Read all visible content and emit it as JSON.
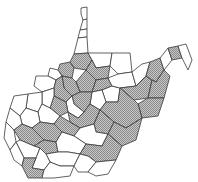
{
  "map": {
    "title": "West Virginia counties",
    "shade_color": "#9a9a9a",
    "plain_color": "#ffffff",
    "border_color": "#3a3a3a",
    "legend": {
      "shaded": "highlighted",
      "plain": "not highlighted"
    },
    "counties": [
      {
        "id": "hancock",
        "shaded": false
      },
      {
        "id": "brooke",
        "shaded": false
      },
      {
        "id": "ohio",
        "shaded": false
      },
      {
        "id": "marshall",
        "shaded": false
      },
      {
        "id": "wetzel",
        "shaded": true
      },
      {
        "id": "monongalia",
        "shaded": false
      },
      {
        "id": "preston",
        "shaded": false
      },
      {
        "id": "tyler",
        "shaded": true
      },
      {
        "id": "pleasants",
        "shaded": false
      },
      {
        "id": "wood",
        "shaded": false
      },
      {
        "id": "ritchie",
        "shaded": true
      },
      {
        "id": "doddridge",
        "shaded": true
      },
      {
        "id": "harrison",
        "shaded": true
      },
      {
        "id": "marion",
        "shaded": true
      },
      {
        "id": "taylor",
        "shaded": true
      },
      {
        "id": "barbour",
        "shaded": false
      },
      {
        "id": "tucker",
        "shaded": false
      },
      {
        "id": "mineral",
        "shaded": false
      },
      {
        "id": "hampshire",
        "shaded": true
      },
      {
        "id": "morgan",
        "shaded": false
      },
      {
        "id": "berkeley",
        "shaded": true
      },
      {
        "id": "jefferson",
        "shaded": false
      },
      {
        "id": "grant",
        "shaded": true
      },
      {
        "id": "hardy",
        "shaded": true
      },
      {
        "id": "pendleton",
        "shaded": true
      },
      {
        "id": "randolph",
        "shaded": true
      },
      {
        "id": "upshur",
        "shaded": false
      },
      {
        "id": "lewis",
        "shaded": true
      },
      {
        "id": "gilmer",
        "shaded": false
      },
      {
        "id": "calhoun",
        "shaded": true
      },
      {
        "id": "wirt",
        "shaded": false
      },
      {
        "id": "jackson",
        "shaded": false
      },
      {
        "id": "mason",
        "shaded": false
      },
      {
        "id": "roane",
        "shaded": false
      },
      {
        "id": "braxton",
        "shaded": true
      },
      {
        "id": "webster",
        "shaded": true
      },
      {
        "id": "pocahontas",
        "shaded": true
      },
      {
        "id": "clay",
        "shaded": true
      },
      {
        "id": "nicholas",
        "shaded": false
      },
      {
        "id": "kanawha",
        "shaded": true
      },
      {
        "id": "putnam",
        "shaded": false
      },
      {
        "id": "cabell",
        "shaded": false
      },
      {
        "id": "wayne",
        "shaded": false
      },
      {
        "id": "lincoln",
        "shaded": true
      },
      {
        "id": "boone",
        "shaded": true
      },
      {
        "id": "fayette",
        "shaded": false
      },
      {
        "id": "greenbrier",
        "shaded": true
      },
      {
        "id": "raleigh",
        "shaded": false
      },
      {
        "id": "logan",
        "shaded": false
      },
      {
        "id": "mingo",
        "shaded": false
      },
      {
        "id": "wyoming",
        "shaded": false
      },
      {
        "id": "mcdowell",
        "shaded": true
      },
      {
        "id": "mercer",
        "shaded": false
      },
      {
        "id": "summers",
        "shaded": false
      },
      {
        "id": "monroe",
        "shaded": false
      }
    ]
  }
}
